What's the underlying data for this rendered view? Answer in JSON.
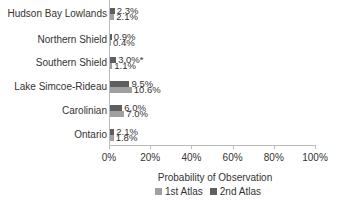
{
  "chart_data": {
    "type": "bar",
    "orientation": "horizontal",
    "title": "",
    "xlabel": "Probability of Observation",
    "ylabel": "",
    "xlim": [
      0,
      100
    ],
    "x_ticks": [
      "0%",
      "20%",
      "40%",
      "60%",
      "80%",
      "100%"
    ],
    "categories": [
      "Hudson Bay Lowlands",
      "Northern Shield",
      "Southern Shield",
      "Lake Simcoe-Rideau",
      "Carolinian",
      "Ontario"
    ],
    "series": [
      {
        "name": "2nd Atlas",
        "color": "#5f5f5f",
        "values": [
          2.3,
          0.9,
          3.0,
          9.5,
          6.0,
          2.1
        ],
        "labels": [
          "2.3%",
          "0.9%",
          "3.0%*",
          "9.5%",
          "6.0%",
          "2.1%"
        ]
      },
      {
        "name": "1st Atlas",
        "color": "#a0a0a0",
        "values": [
          2.1,
          0.4,
          1.1,
          10.6,
          7.0,
          1.8
        ],
        "labels": [
          "2.1%",
          "0.4%",
          "1.1%",
          "10.6%",
          "7.0%",
          "1.8%"
        ]
      }
    ],
    "legend": [
      "1st Atlas",
      "2nd Atlas"
    ],
    "legend_position": "bottom",
    "grid": false
  }
}
